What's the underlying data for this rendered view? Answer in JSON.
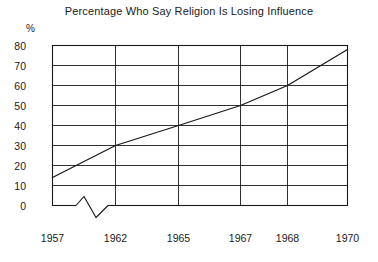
{
  "chart_data": {
    "type": "line",
    "title": "Percentage Who Say Religion Is Losing Influence",
    "xlabel": "",
    "ylabel": "%",
    "y_unit_symbol": "%",
    "ylim": [
      0,
      80
    ],
    "yticks": [
      0,
      10,
      20,
      30,
      40,
      50,
      60,
      70,
      80
    ],
    "ytick_labels": [
      "0",
      "10",
      "20",
      "30",
      "40",
      "50",
      "60",
      "70",
      "80"
    ],
    "xtick_labels": [
      "1957",
      "1962",
      "1965",
      "1967",
      "1968",
      "1970"
    ],
    "x": [
      1957,
      1962,
      1965,
      1967,
      1968,
      1970
    ],
    "values": [
      14,
      30,
      40,
      50,
      60,
      78
    ],
    "series": [
      {
        "name": "Percentage Who Say Religion Is Losing Influence",
        "values": [
          14,
          30,
          40,
          50,
          60,
          78
        ]
      }
    ],
    "grid": true,
    "grid_horizontal": true,
    "grid_vertical": true,
    "legend": false,
    "legend_position": "none",
    "axis_break": true,
    "axis_break_note": "zigzag break on x-axis between 1957 and 1962",
    "line_color": "#1a1a1a",
    "frame_color": "#1a1a1a",
    "background_color": "#ffffff"
  }
}
